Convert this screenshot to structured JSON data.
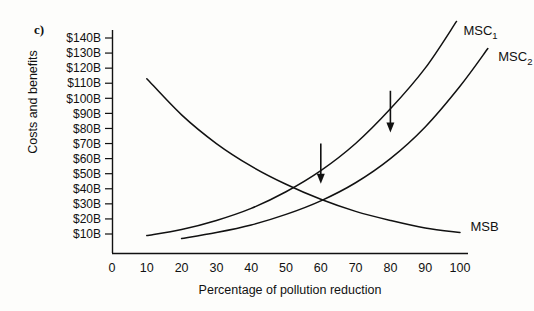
{
  "figure": {
    "panel_label": "c)",
    "ylabel": "Costs and benefits",
    "xlabel": "Percentage of pollution reduction"
  },
  "chart_data": {
    "type": "line",
    "title": "",
    "subtitle": "",
    "xlabel": "Percentage of pollution reduction",
    "ylabel": "Costs and benefits",
    "xlim": [
      0,
      100
    ],
    "ylim": [
      0,
      145
    ],
    "xticks": [
      0,
      10,
      20,
      30,
      40,
      50,
      60,
      70,
      80,
      90,
      100
    ],
    "xtick_labels": [
      "0",
      "10",
      "20",
      "30",
      "40",
      "50",
      "60",
      "70",
      "80",
      "90",
      "100"
    ],
    "yticks": [
      10,
      20,
      30,
      40,
      50,
      60,
      70,
      80,
      90,
      100,
      110,
      120,
      130,
      140
    ],
    "ytick_labels": [
      "$10B",
      "$20B",
      "$30B",
      "$40B",
      "$50B",
      "$60B",
      "$70B",
      "$80B",
      "$90B",
      "$100B",
      "$110B",
      "$120B",
      "$130B",
      "$140B"
    ],
    "grid": false,
    "legend_position": "inline-curve-labels",
    "series": [
      {
        "name": "MSC_1",
        "label": "MSC",
        "label_subscript": "1",
        "label_x": 101,
        "label_y": 142,
        "shape": "convex-increasing",
        "x": [
          10,
          20,
          30,
          40,
          50,
          60,
          70,
          80,
          90,
          99
        ],
        "y": [
          9,
          13,
          19,
          27,
          38,
          52,
          70,
          93,
          120,
          151
        ]
      },
      {
        "name": "MSC_2",
        "label": "MSC",
        "label_subscript": "2",
        "label_x": 111,
        "label_y": 125,
        "shape": "convex-increasing",
        "x": [
          20,
          30,
          40,
          50,
          60,
          70,
          80,
          90,
          100,
          108
        ],
        "y": [
          7,
          11,
          16,
          23,
          32,
          44,
          60,
          81,
          108,
          133
        ]
      },
      {
        "name": "MSB",
        "label": "MSB",
        "label_subscript": "",
        "label_x": 103,
        "label_y": 12,
        "shape": "convex-decreasing",
        "x": [
          10,
          20,
          30,
          40,
          50,
          60,
          70,
          80,
          90,
          100
        ],
        "y": [
          113,
          89,
          70,
          55,
          43,
          33,
          25,
          19,
          14,
          11
        ]
      }
    ],
    "annotations": [
      {
        "name": "shift-arrow-left",
        "type": "down-arrow",
        "x": 60,
        "y_top": 70,
        "y_bottom": 44,
        "meaning": "MSC shifts downward"
      },
      {
        "name": "shift-arrow-right",
        "type": "down-arrow",
        "x": 80,
        "y_top": 105,
        "y_bottom": 78,
        "meaning": "MSC shifts downward"
      }
    ],
    "colors": {
      "curve": "#111111",
      "axis": "#111111",
      "background": "#fdfdfb"
    }
  }
}
